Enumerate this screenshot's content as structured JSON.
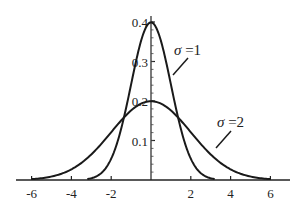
{
  "chart_data": {
    "type": "line",
    "title": "",
    "xlabel": "",
    "ylabel": "",
    "xlim": [
      -6.5,
      6.5
    ],
    "ylim": [
      0,
      0.42
    ],
    "grid": false,
    "x_ticks": [
      -6,
      -4,
      -2,
      2,
      4,
      6
    ],
    "x_tick_labels": [
      "-6",
      "-4",
      "-2",
      "2",
      "4",
      "6"
    ],
    "y_ticks": [
      0.1,
      0.2,
      0.3,
      0.4
    ],
    "y_tick_labels": [
      "0.1",
      "0.2",
      "0.3",
      "0.4"
    ],
    "series": [
      {
        "name": "σ=1",
        "description": "Normal density, mean 0, standard deviation 1",
        "mu": 0,
        "sigma": 1,
        "x": [
          -3.2,
          -3,
          -2.5,
          -2,
          -1.5,
          -1,
          -0.5,
          0,
          0.5,
          1,
          1.5,
          2,
          2.5,
          3,
          3.2
        ],
        "values": [
          0.002,
          0.004,
          0.018,
          0.054,
          0.13,
          0.242,
          0.352,
          0.399,
          0.352,
          0.242,
          0.13,
          0.054,
          0.018,
          0.004,
          0.002
        ]
      },
      {
        "name": "σ=2",
        "description": "Normal density, mean 0, standard deviation 2",
        "mu": 0,
        "sigma": 2,
        "x": [
          -6,
          -5,
          -4,
          -3,
          -2,
          -1,
          0,
          1,
          2,
          3,
          4,
          5,
          6
        ],
        "values": [
          0.002,
          0.009,
          0.027,
          0.065,
          0.121,
          0.176,
          0.199,
          0.176,
          0.121,
          0.065,
          0.027,
          0.009,
          0.002
        ]
      }
    ],
    "annotations": [
      {
        "text_symbol": "σ",
        "text_rest": " =1",
        "target_series": "σ=1"
      },
      {
        "text_symbol": "σ",
        "text_rest": " =2",
        "target_series": "σ=2"
      }
    ],
    "legend_position": "inline annotations with leader lines"
  }
}
